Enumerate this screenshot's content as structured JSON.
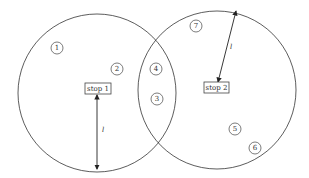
{
  "diagram": {
    "stops": [
      {
        "id": "stop-1",
        "label": "stop 1"
      },
      {
        "id": "stop-2",
        "label": "stop 2"
      }
    ],
    "nodes": [
      {
        "label": "1"
      },
      {
        "label": "2"
      },
      {
        "label": "4"
      },
      {
        "label": "3"
      },
      {
        "label": "7"
      },
      {
        "label": "5"
      },
      {
        "label": "6"
      }
    ],
    "radius_label_1": "l",
    "radius_label_2": "l"
  }
}
